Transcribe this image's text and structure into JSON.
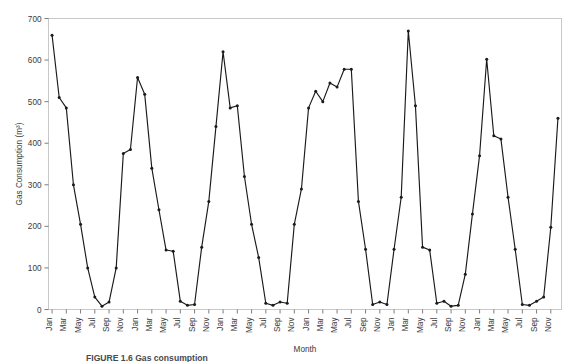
{
  "figure": {
    "caption": "FIGURE 1.6   Gas consumption",
    "background": "#ffffff",
    "line_color": "#1a1a1a",
    "frame_color": "#c8c8c8",
    "text_color": "#3a3a3a"
  },
  "chart_data": {
    "type": "line",
    "title": "",
    "xlabel": "Month",
    "ylabel": "Gas Consumption (m³)",
    "ylim": [
      0,
      700
    ],
    "ytick_labels": [
      "0",
      "100",
      "200",
      "300",
      "400",
      "500",
      "600",
      "700"
    ],
    "ytick_values": [
      0,
      100,
      200,
      300,
      400,
      500,
      600,
      700
    ],
    "grid": false,
    "legend": "none",
    "marker": "dot",
    "x": [
      "Jan",
      "Feb",
      "Mar",
      "Apr",
      "May",
      "Jun",
      "Jul",
      "Aug",
      "Sep",
      "Oct",
      "Nov",
      "Dec",
      "Jan",
      "Feb",
      "Mar",
      "Apr",
      "May",
      "Jun",
      "Jul",
      "Aug",
      "Sep",
      "Oct",
      "Nov",
      "Dec",
      "Jan",
      "Feb",
      "Mar",
      "Apr",
      "May",
      "Jun",
      "Jul",
      "Aug",
      "Sep",
      "Oct",
      "Nov",
      "Dec",
      "Jan",
      "Feb",
      "Mar",
      "Apr",
      "May",
      "Jun",
      "Jul",
      "Aug",
      "Sep",
      "Oct",
      "Nov",
      "Dec",
      "Jan",
      "Feb",
      "Mar",
      "Apr",
      "May",
      "Jun",
      "Jul",
      "Aug",
      "Sep",
      "Oct",
      "Nov",
      "Dec",
      "Jan",
      "Feb",
      "Mar",
      "Apr",
      "May",
      "Jun",
      "Jul",
      "Aug",
      "Sep",
      "Oct",
      "Nov",
      "Dec"
    ],
    "xtick_labels": [
      "Jan",
      "Mar",
      "May",
      "Jul",
      "Sep",
      "Nov",
      "Jan",
      "Mar",
      "May",
      "Jul",
      "Sep",
      "Nov",
      "Jan",
      "Mar",
      "May",
      "Jul",
      "Sep",
      "Nov",
      "Jan",
      "Mar",
      "May",
      "Jul",
      "Sep",
      "Nov",
      "Jan",
      "Mar",
      "May",
      "Jul",
      "Sep",
      "Nov",
      "Jan",
      "Mar",
      "May",
      "Jul",
      "Sep",
      "Nov"
    ],
    "values": [
      660,
      510,
      485,
      300,
      205,
      100,
      30,
      8,
      18,
      100,
      375,
      385,
      558,
      518,
      340,
      240,
      143,
      140,
      20,
      10,
      12,
      150,
      260,
      440,
      620,
      485,
      490,
      320,
      205,
      125,
      15,
      10,
      18,
      15,
      205,
      290,
      485,
      525,
      500,
      545,
      535,
      578,
      578,
      260,
      145,
      12,
      18,
      12,
      145,
      270,
      670,
      490,
      150,
      143,
      15,
      20,
      8,
      10,
      85,
      230,
      370,
      602,
      418,
      410,
      270,
      145,
      12,
      10,
      20,
      30,
      198,
      460
    ],
    "series_name": "Gas Consumption"
  }
}
